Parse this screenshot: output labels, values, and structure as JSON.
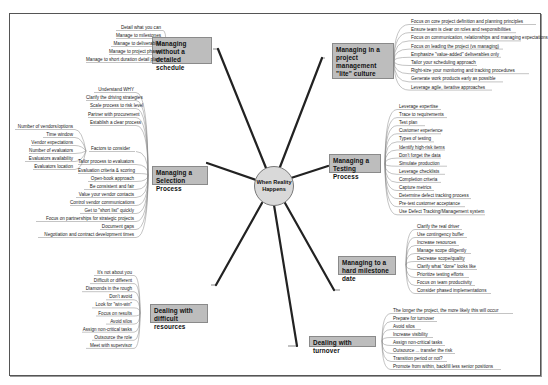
{
  "center": {
    "label": "When Reality Happens"
  },
  "colors": {
    "topic_fill": "#bdbdbd",
    "topic_border": "#8a8a8a",
    "line": "#222222",
    "frame": "#555555"
  },
  "branches": {
    "schedule": {
      "title": "Managing without a detailed schedule",
      "items": [
        "Detail what you can",
        "Manage to milestones",
        "Manage to deliverables",
        "Manage to project phases",
        "Manage to short duration detail plans"
      ]
    },
    "culture": {
      "title": "Managing in a project management \"lite\" culture",
      "items": [
        "Focus on core project definition and planning principles",
        "Ensure team is clear on roles and responsibilities",
        "Focus on communication, relationships and managing expectations",
        "Focus on leading the project (vs managing)",
        "Emphasize \"value-added\" deliverables only",
        "Tailor your scheduling approach",
        "Right-size your monitoring and tracking procedures",
        "Generate work products early as possible",
        "Leverage agile, iterative approaches"
      ]
    },
    "selection": {
      "title": "Managing a Selection Process",
      "items": [
        "Understand WHY",
        "Clarify the driving strategies",
        "Scale process to risk level",
        "Partner with procurement",
        "Establish a clear process",
        "Factors to consider",
        "Tailor process to evaluators",
        "Evaluation criteria & scoring",
        "Open-book approach",
        "Be consistent and fair",
        "Value your vendor contacts",
        "Control vendor communications",
        "Get to \"short list\" quickly",
        "Focus on partnerships for strategic projects",
        "Document gaps",
        "Negotiation and contract development times"
      ],
      "factors": [
        "Number of vendors/options",
        "Time window",
        "Vendor expectations",
        "Number of evaluators",
        "Evaluators availability",
        "Evaluators location"
      ]
    },
    "testing": {
      "title": "Managing a Testing Process",
      "items": [
        "Leverage expertise",
        "Trace to requirements",
        "Test plan",
        "Customer experience",
        "Types of testing",
        "Identify high-risk items",
        "Don't forget the data",
        "Simulate production",
        "Leverage checklists",
        "Completion criteria",
        "Capture metrics",
        "Determine defect tracking process",
        "Pre-test customer acceptance",
        "Use Defect Tracking/Management system"
      ]
    },
    "milestone": {
      "title": "Managing to a hard milestone date",
      "items": [
        "Clarify the real driver",
        "Use contingency buffer",
        "Increase resources",
        "Manage scope diligently",
        "Decrease scope/quality",
        "Clarify what \"done\" looks like",
        "Prioritize testing efforts",
        "Focus on team productivity",
        "Consider phased implementations"
      ]
    },
    "difficult": {
      "title": "Dealing with difficult resources",
      "items": [
        "It's not about you",
        "Difficult or different",
        "Diamonds in the rough",
        "Don't avoid",
        "Look for \"win-win\"",
        "Focus on results",
        "Avoid silos",
        "Assign non-critical tasks",
        "Outsource the role",
        "Meet with supervisor"
      ]
    },
    "turnover": {
      "title": "Dealing with turnover",
      "items": [
        "The longer the project, the more likely this will occur",
        "Prepare for turnover",
        "Avoid silos",
        "Increase visibility",
        "Assign non-critical tasks",
        "Outsource ... transfer the risk",
        "Transition period or not?",
        "Promote from within, backfill less senior positions"
      ]
    }
  }
}
